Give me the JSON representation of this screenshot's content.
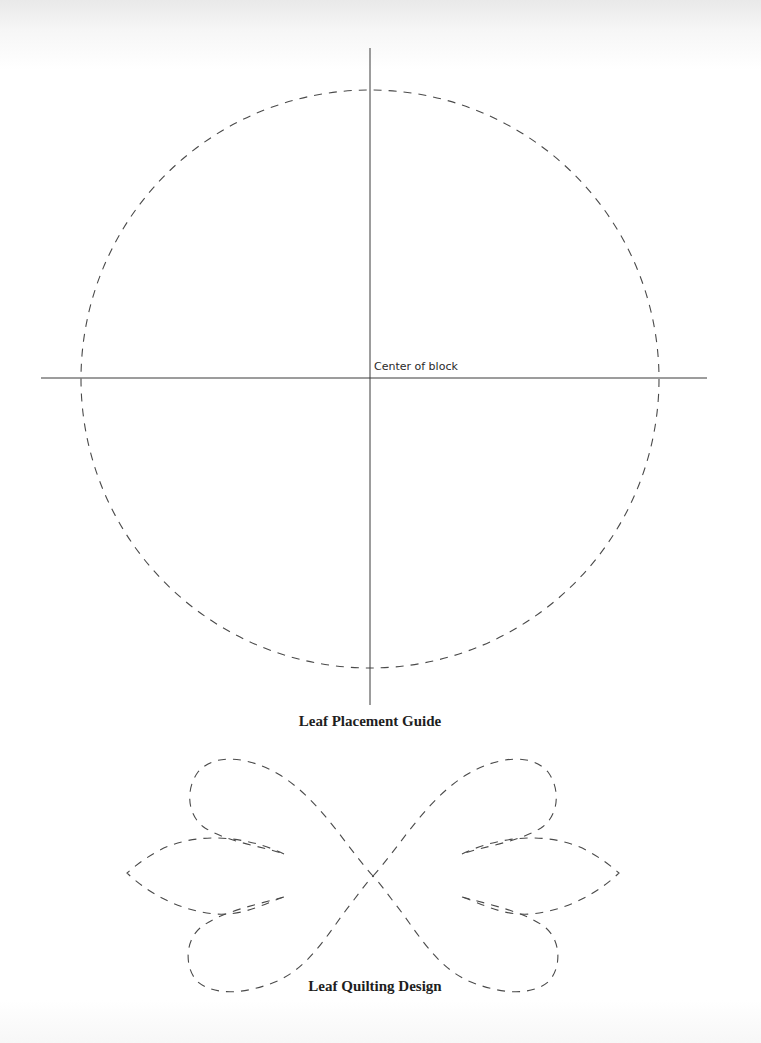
{
  "document": {
    "type": "quilting pattern page",
    "background_color": "#ffffff",
    "line_color": "#3a3a3a"
  },
  "placement_guide": {
    "center_label": "Center of block",
    "caption": "Leaf Placement Guide",
    "circle": {
      "cx": 370,
      "cy": 379,
      "r": 289,
      "style": "dashed"
    },
    "vertical_axis": {
      "x": 370,
      "y1": 48,
      "y2": 705
    },
    "horizontal_axis": {
      "y": 378,
      "x1": 41,
      "x2": 707
    }
  },
  "quilting_design": {
    "caption": "Leaf Quilting Design",
    "style": "dashed",
    "center": {
      "x": 373,
      "y": 875
    }
  }
}
